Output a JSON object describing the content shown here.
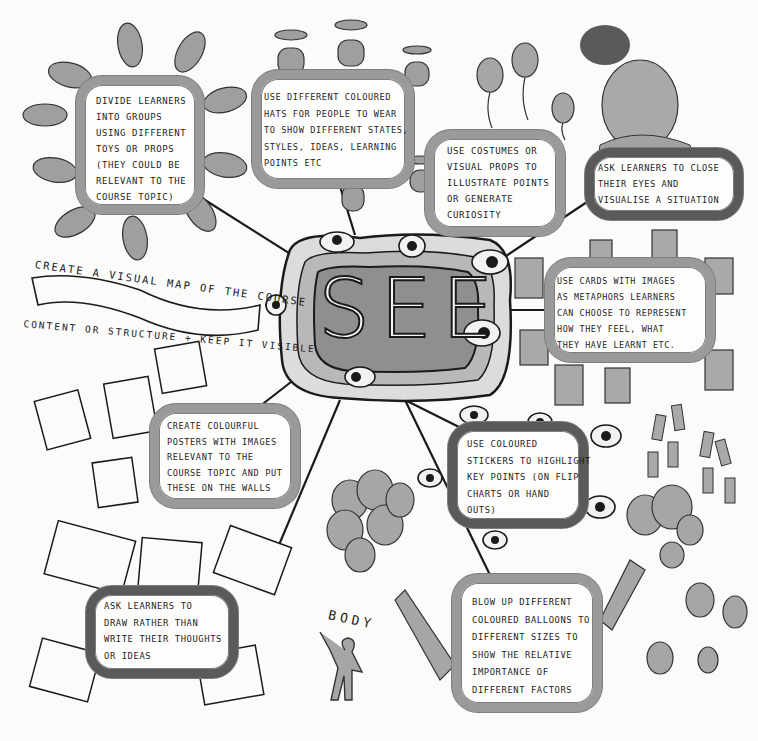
{
  "center": {
    "title": "SEE"
  },
  "nodes": [
    {
      "id": "groups",
      "text": "Divide learners\ninto groups\nusing different\ntoys or props\n(they could be\nrelevant to the\ncourse topic)"
    },
    {
      "id": "hats",
      "text": "Use different coloured\nhats for people to wear\nto show different states,\nstyles, ideas, learning\npoints etc"
    },
    {
      "id": "costumes",
      "text": "Use costumes or\nvisual props to\nillustrate points\nor generate\ncuriosity"
    },
    {
      "id": "close-eyes",
      "text": "Ask learners to close\ntheir eyes and\nvisualise a situation"
    },
    {
      "id": "cards",
      "text": "Use cards with images\nas metaphors learners\ncan choose to represent\nhow they feel, what\nthey have learnt etc."
    },
    {
      "id": "posters",
      "text": "Create colourful\nposters with images\nrelevant to the\ncourse topic and put\nthese on the walls"
    },
    {
      "id": "stickers",
      "text": "Use coloured\nstickers to highlight\nkey points (on flip\ncharts or hand\nouts)"
    },
    {
      "id": "draw",
      "text": "Ask learners to\ndraw rather than\nwrite their thoughts\nor ideas"
    },
    {
      "id": "balloons",
      "text": "Blow up different\ncoloured balloons to\ndifferent sizes to\nshow the relative\nimportance of\ndifferent factors"
    }
  ],
  "banner": {
    "top": "Create a visual map of the course",
    "bottom": "content or structure + keep it visible"
  },
  "labels": {
    "body": "BODY"
  },
  "colors": {
    "paper": "#fbfbfa",
    "ink": "#1a1a1a",
    "frame": "#9a9a9a",
    "center_fill": "#8f8f8f",
    "fill_grey": "#a8a8a8"
  }
}
